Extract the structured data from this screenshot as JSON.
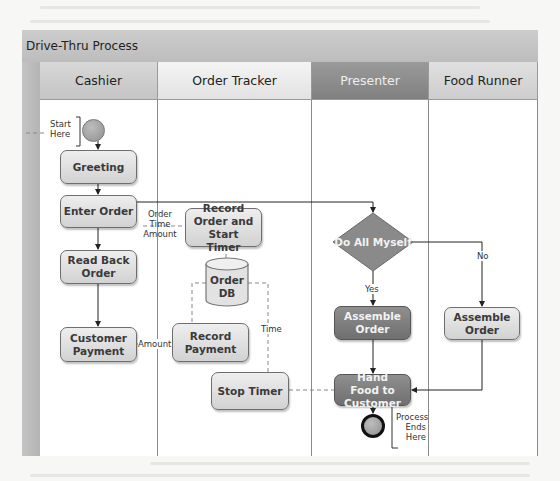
{
  "diagram": {
    "title": "Drive-Thru Process",
    "lanes": [
      {
        "name": "Cashier"
      },
      {
        "name": "Order Tracker"
      },
      {
        "name": "Presenter"
      },
      {
        "name": "Food Runner"
      }
    ],
    "nodes": {
      "start_label": "Start Here",
      "greeting": "Greeting",
      "enter_order": "Enter Order",
      "read_back_order": "Read Back Order",
      "customer_payment": "Customer Payment",
      "record_order": "Record Order and Start Timer",
      "order_db": "Order DB",
      "record_payment": "Record Payment",
      "stop_timer": "Stop Timer",
      "decision": "Do All Myself",
      "assemble_order_presenter": "Assemble Order",
      "assemble_order_runner": "Assemble Order",
      "hand_food": "Hand Food to Customer",
      "end_label": "Process Ends Here"
    },
    "edge_labels": {
      "order_time_amount_1": "Order",
      "order_time_amount_2": "Time",
      "order_time_amount_3": "Amount",
      "amount": "Amount",
      "time": "Time",
      "yes": "Yes",
      "no": "No"
    },
    "colors": {
      "title_bar": "#c4c4c4",
      "presenter_header": "#8c8c8c",
      "light_shape": "#e0e0e0",
      "dark_shape": "#7f7f7f"
    }
  }
}
